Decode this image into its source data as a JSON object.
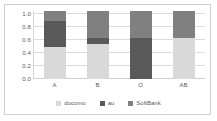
{
  "chart_data": {
    "type": "bar",
    "subtype": "stacked-100",
    "title": "",
    "xlabel": "",
    "ylabel": "",
    "categories": [
      "A",
      "B",
      "O",
      "AB"
    ],
    "series": [
      {
        "name": "docomo",
        "color": "#d9d9d9",
        "values": [
          0.47,
          0.52,
          0.0,
          0.61
        ]
      },
      {
        "name": "au",
        "color": "#595959",
        "values": [
          0.39,
          0.08,
          0.6,
          0.0
        ]
      },
      {
        "name": "SoftBank",
        "color": "#808080",
        "values": [
          0.14,
          0.4,
          0.4,
          0.39
        ]
      }
    ],
    "ylim": [
      0.0,
      1.0
    ],
    "ytick_labels": [
      "1.0",
      "0.8",
      "0.6",
      "0.4",
      "0.2",
      "0.0"
    ],
    "ytick_values": [
      1.0,
      0.8,
      0.6,
      0.4,
      0.2,
      0.0
    ],
    "grid": true,
    "grid_axis": "y",
    "legend_position": "bottom"
  },
  "legend": {
    "items": [
      {
        "label": "docomo"
      },
      {
        "label": "au"
      },
      {
        "label": "SoftBank"
      }
    ]
  },
  "colors": {
    "docomo": "#d9d9d9",
    "au": "#595959",
    "softbank": "#808080",
    "gridline": "#dcdcdc",
    "axis_text": "#5a5a5a",
    "frame": "#d0d0d0",
    "background": "#ffffff"
  }
}
